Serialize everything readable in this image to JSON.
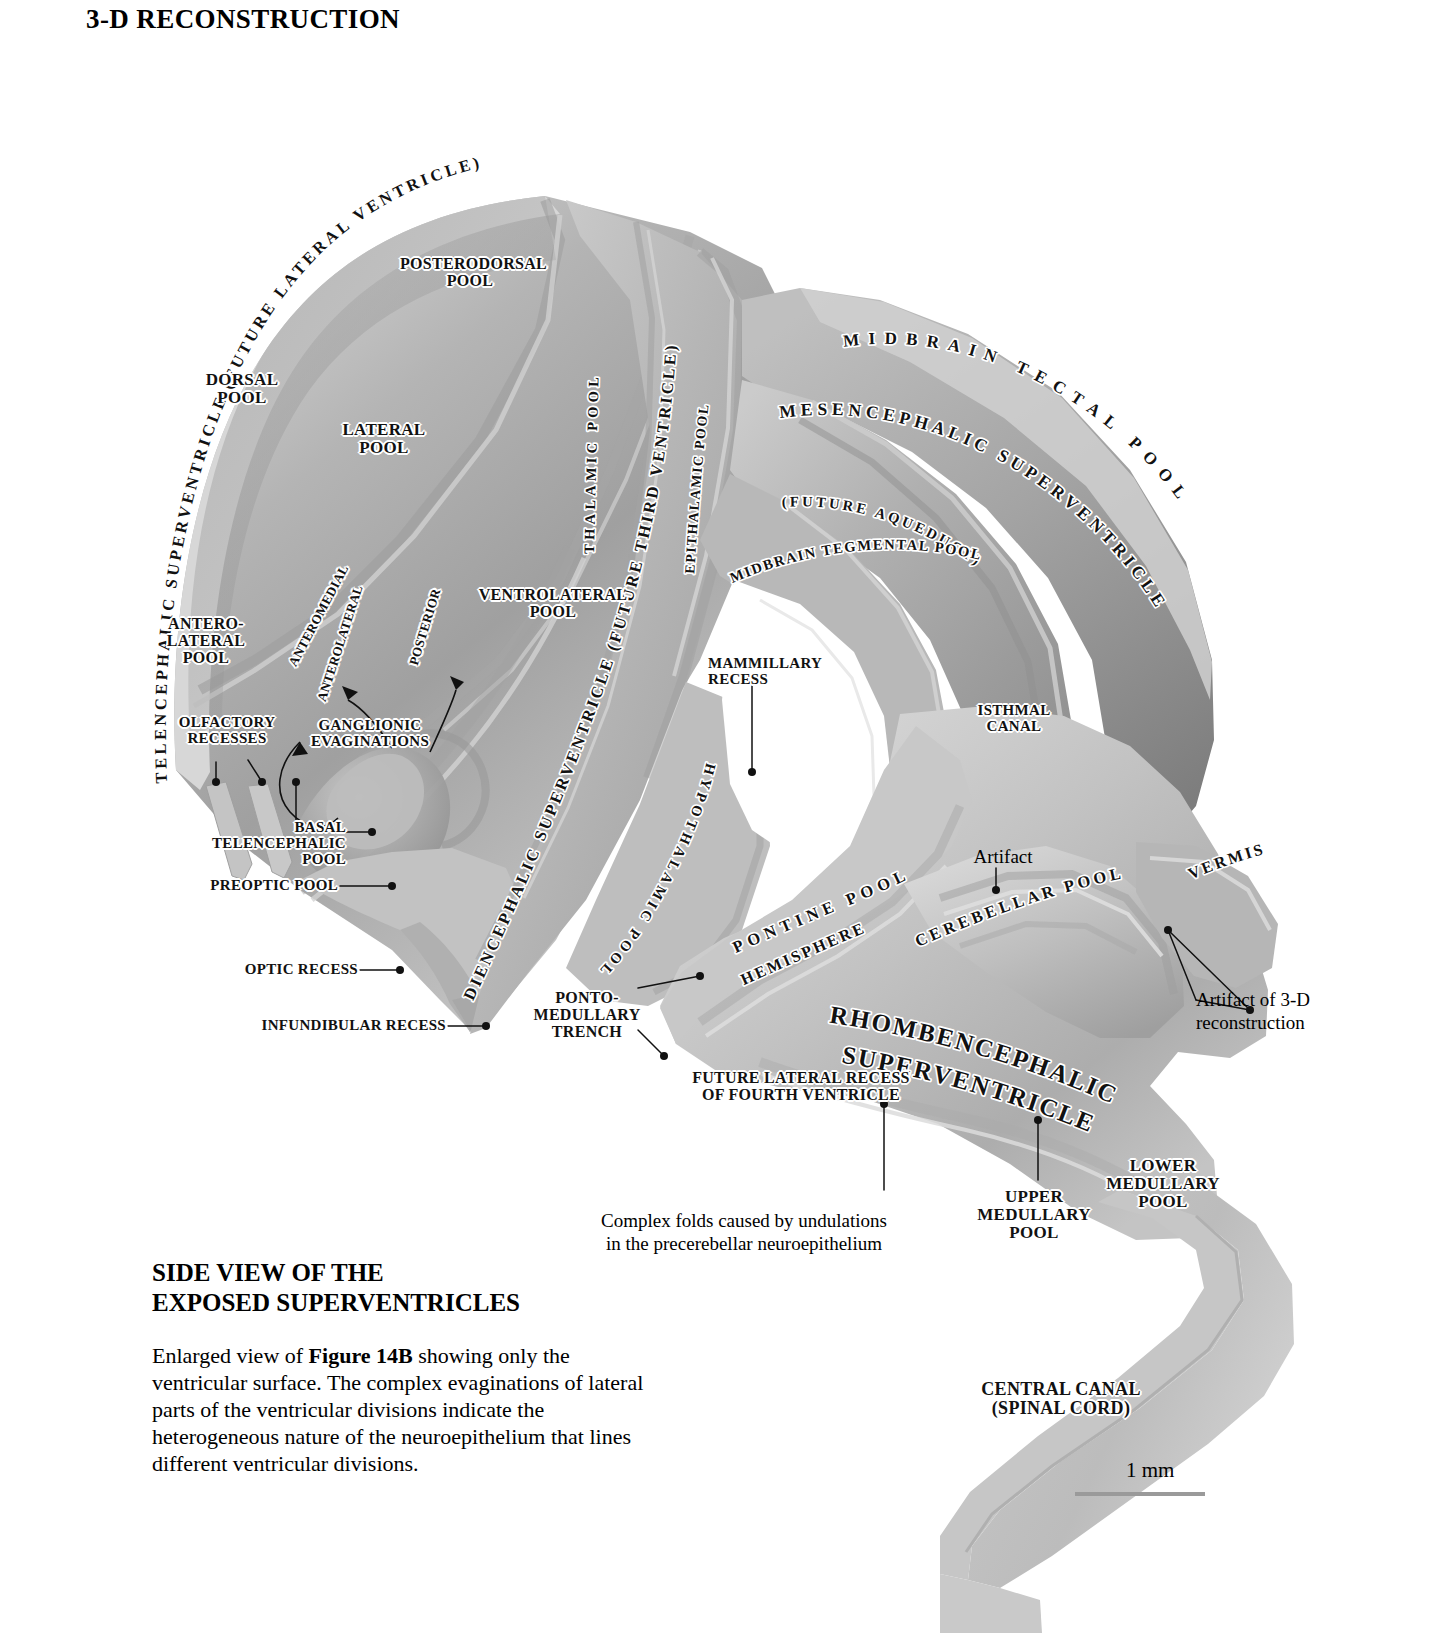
{
  "figure": {
    "title": "3-D RECONSTRUCTION",
    "section_title": "SIDE VIEW OF THE\nEXPOSED SUPERVENTRICLES",
    "caption_prefix": "Enlarged view of ",
    "caption_bold": "Figure 14B",
    "caption_rest": " showing only the ventricular surface.  The complex evaginations of lateral parts of the ventricular divisions indicate the heterogeneous nature of the neuroepithelium that lines different ventricular divisions.",
    "scale_label": "1 mm"
  },
  "superventricles": {
    "telencephalic": "TELENCEPHALIC SUPERVENTRICLE (FUTURE LATERAL VENTRICLE)",
    "diencephalic": "DIENCEPHALIC SUPERVENTRICLE (FUTURE THIRD VENTRICLE)",
    "mesencephalic": "MESENCEPHALIC SUPERVENTRICLE",
    "mesencephalic_sub": "(FUTURE AQUEDUCT)",
    "rhombencephalic": "RHOMBENCEPHALIC\nSUPERVENTRICLE"
  },
  "labels": {
    "posterodorsal_pool": "POSTERODORSAL\nPOOL",
    "dorsal_pool": "DORSAL\nPOOL",
    "lateral_pool": "LATERAL\nPOOL",
    "ventrolateral_pool": "VENTROLATERAL\nPOOL",
    "anterolateral_pool": "ANTERO-\nLATERAL\nPOOL",
    "olfactory_recesses": "OLFACTORY\nRECESSES",
    "ganglionic_evaginations": "GANGLIONIC\nEVAGINATIONS",
    "anteromedial": "ANTEROMEDIAL",
    "anterolateral": "ANTEROLATERAL",
    "posterior": "POSTERIOR",
    "basal_telencephalic_pool": "BASAL\nTELENCEPHALIC\nPOOL",
    "preoptic_pool": "PREOPTIC POOL",
    "optic_recess": "OPTIC RECESS",
    "infundibular_recess": "INFUNDIBULAR RECESS",
    "thalamic_pool": "THALAMIC POOL",
    "epithalamic_pool": "EPITHALAMIC POOL",
    "hypothalamic_pool": "HYPOTHALAMIC POOL",
    "mammillary_recess": "MAMMILLARY\nRECESS",
    "midbrain_tegmental_pool": "MIDBRAIN TEGMENTAL POOL",
    "midbrain_tectal_pool": "MIDBRAIN TECTAL POOL",
    "isthmal_canal": "ISTHMAL\nCANAL",
    "pontine_pool": "PONTINE POOL",
    "hemisphere": "HEMISPHERE",
    "cerebellar_pool": "CEREBELLAR POOL",
    "vermis": "VERMIS",
    "artifact": "Artifact",
    "artifact_3d": "Artifact of 3-D\nreconstruction",
    "ponto_medullary_trench": "PONTO-\nMEDULLARY\nTRENCH",
    "future_lateral_recess": "FUTURE LATERAL RECESS\nOF FOURTH VENTRICLE",
    "complex_folds_note": "Complex folds caused by undulations\nin the precerebellar neuroepithelium",
    "upper_medullary_pool": "UPPER\nMEDULLARY\nPOOL",
    "lower_medullary_pool": "LOWER\nMEDULLARY\nPOOL",
    "central_canal": "CENTRAL CANAL\n(SPINAL CORD)"
  },
  "colors": {
    "ink": "#111111",
    "halo": "#ffffff",
    "surface_light": "#e2e2e2",
    "surface_mid": "#b9b9b9",
    "surface_dark": "#8a8a8a",
    "surface_shadow": "#6c6c6c"
  }
}
